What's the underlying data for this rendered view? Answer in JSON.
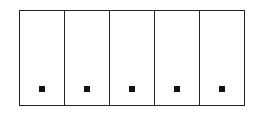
{
  "diagram": {
    "type": "segmented-rectangle",
    "panel_count": 5,
    "border_color": "#222222",
    "dot_color": "#111111",
    "panels": [
      {
        "index": 1,
        "marker": "square-dot"
      },
      {
        "index": 2,
        "marker": "square-dot"
      },
      {
        "index": 3,
        "marker": "square-dot"
      },
      {
        "index": 4,
        "marker": "square-dot"
      },
      {
        "index": 5,
        "marker": "square-dot"
      }
    ]
  }
}
